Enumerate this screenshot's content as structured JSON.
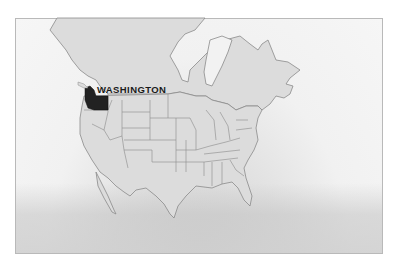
{
  "map": {
    "highlighted_state": "WASHINGTON",
    "colors": {
      "land": "#dcdcdc",
      "borders": "#8a8a8a",
      "highlight": "#222222",
      "water": "#f2f2f2"
    }
  }
}
